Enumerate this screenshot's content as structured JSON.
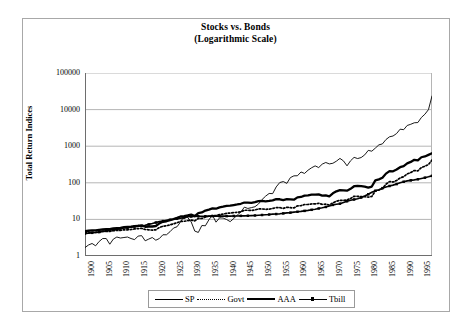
{
  "chart_data": {
    "type": "line",
    "title": "Stocks vs. Bonds",
    "subtitle": "(Logarithmic Scale)",
    "xlabel": "",
    "ylabel": "Total Return Indices",
    "scale": "log",
    "grid": true,
    "legend_position": "bottom",
    "ylim": [
      1,
      100000
    ],
    "xlim": [
      1900,
      1998
    ],
    "ytick_labels": [
      "100000",
      "10000",
      "1000",
      "100",
      "10",
      "1"
    ],
    "ytick_values": [
      100000,
      10000,
      1000,
      100,
      10,
      1
    ],
    "xtick_labels": [
      "1900",
      "1905",
      "1910",
      "1915",
      "1920",
      "1925",
      "1930",
      "1935",
      "1940",
      "1945",
      "1950",
      "1955",
      "1960",
      "1965",
      "1970",
      "1975",
      "1980",
      "1985",
      "1990",
      "1995"
    ],
    "xtick_values": [
      1900,
      1905,
      1910,
      1915,
      1920,
      1925,
      1930,
      1935,
      1940,
      1945,
      1950,
      1955,
      1960,
      1965,
      1970,
      1975,
      1980,
      1985,
      1990,
      1995
    ],
    "x": [
      1900,
      1901,
      1902,
      1903,
      1904,
      1905,
      1906,
      1907,
      1908,
      1909,
      1910,
      1911,
      1912,
      1913,
      1914,
      1915,
      1916,
      1917,
      1918,
      1919,
      1920,
      1921,
      1922,
      1923,
      1924,
      1925,
      1926,
      1927,
      1928,
      1929,
      1930,
      1931,
      1932,
      1933,
      1934,
      1935,
      1936,
      1937,
      1938,
      1939,
      1940,
      1941,
      1942,
      1943,
      1944,
      1945,
      1946,
      1947,
      1948,
      1949,
      1950,
      1951,
      1952,
      1953,
      1954,
      1955,
      1956,
      1957,
      1958,
      1959,
      1960,
      1961,
      1962,
      1963,
      1964,
      1965,
      1966,
      1967,
      1968,
      1969,
      1970,
      1971,
      1972,
      1973,
      1974,
      1975,
      1976,
      1977,
      1978,
      1979,
      1980,
      1981,
      1982,
      1983,
      1984,
      1985,
      1986,
      1987,
      1988,
      1989,
      1990,
      1991,
      1992,
      1993,
      1994,
      1995,
      1996,
      1997,
      1998
    ],
    "series": [
      {
        "name": "SP",
        "style": "thin-solid",
        "color": "#000000",
        "values": [
          1.7,
          2.0,
          2.2,
          1.9,
          2.5,
          3.0,
          3.0,
          2.1,
          2.9,
          3.3,
          3.1,
          3.2,
          3.3,
          3.0,
          2.8,
          3.5,
          3.6,
          2.6,
          2.9,
          3.2,
          2.7,
          3.0,
          3.8,
          3.8,
          4.6,
          5.8,
          6.3,
          8.6,
          12.3,
          11.3,
          8.5,
          4.8,
          4.4,
          6.8,
          6.7,
          9.8,
          13.1,
          8.4,
          11.0,
          10.9,
          9.9,
          8.7,
          10.5,
          13.2,
          15.8,
          21.6,
          19.9,
          21.0,
          22.2,
          26.4,
          34.8,
          43.1,
          51.1,
          50.6,
          77.2,
          101.5,
          108.1,
          96.5,
          138.5,
          155.0,
          155.8,
          197.5,
          180.3,
          221.2,
          257.9,
          290.0,
          260.9,
          323.4,
          358.8,
          328.2,
          341.4,
          390.2,
          464.2,
          396.0,
          291.0,
          399.6,
          495.2,
          459.9,
          489.9,
          580.4,
          768.4,
          730.6,
          887.9,
          1088.0,
          1156.0,
          1522.0,
          1806.0,
          1901.0,
          2216.0,
          2917.0,
          2825.0,
          3688.0,
          3969.0,
          4368.0,
          4425.0,
          6088.0,
          7484.0,
          9978.0,
          23500.0
        ]
      },
      {
        "name": "Govt",
        "style": "dotted",
        "color": "#000000",
        "values": [
          4.3,
          4.3,
          4.4,
          4.4,
          4.6,
          4.7,
          4.7,
          4.7,
          4.9,
          5.0,
          5.0,
          5.2,
          5.2,
          5.3,
          5.5,
          5.6,
          5.7,
          5.3,
          5.2,
          5.1,
          5.2,
          6.0,
          6.5,
          6.7,
          7.1,
          7.6,
          8.1,
          8.8,
          8.9,
          9.2,
          9.6,
          9.1,
          10.6,
          10.6,
          11.6,
          12.2,
          12.8,
          12.8,
          13.5,
          13.9,
          14.7,
          14.9,
          15.3,
          15.7,
          16.1,
          17.8,
          17.8,
          17.5,
          18.1,
          19.3,
          19.3,
          18.8,
          19.1,
          19.8,
          21.1,
          20.9,
          20.0,
          21.4,
          20.9,
          20.5,
          23.4,
          23.7,
          25.5,
          25.5,
          26.4,
          26.6,
          27.5,
          25.8,
          26.1,
          24.7,
          28.3,
          31.4,
          33.1,
          32.8,
          34.2,
          37.3,
          42.9,
          42.6,
          42.1,
          41.8,
          40.6,
          42.3,
          60.3,
          63.3,
          69.7,
          91.6,
          108.0,
          104.9,
          115.6,
          135.8,
          147.1,
          175.3,
          190.0,
          217.0,
          211.0,
          262.0,
          283.0,
          316.0,
          420.0
        ]
      },
      {
        "name": "AAA",
        "style": "thick-solid",
        "color": "#000000",
        "values": [
          4.8,
          4.9,
          5.0,
          5.0,
          5.2,
          5.3,
          5.4,
          5.4,
          5.7,
          5.8,
          5.9,
          6.1,
          6.2,
          6.3,
          6.5,
          6.7,
          6.8,
          6.3,
          6.4,
          6.4,
          6.6,
          7.8,
          8.6,
          8.9,
          9.6,
          10.2,
          11.0,
          12.0,
          12.3,
          12.8,
          13.5,
          12.3,
          14.8,
          15.5,
          17.4,
          18.6,
          20.0,
          19.6,
          21.4,
          22.2,
          23.5,
          23.7,
          24.7,
          25.6,
          26.7,
          28.9,
          28.8,
          28.2,
          29.5,
          31.7,
          32.0,
          31.1,
          32.0,
          33.2,
          35.8,
          35.5,
          33.8,
          35.9,
          35.2,
          34.6,
          40.0,
          41.0,
          44.6,
          45.2,
          47.3,
          47.7,
          48.3,
          44.6,
          45.6,
          42.8,
          51.5,
          58.4,
          62.7,
          62.3,
          60.9,
          68.4,
          80.7,
          82.1,
          81.2,
          78.5,
          73.7,
          79.1,
          116.0,
          124.0,
          137.0,
          178.0,
          208.0,
          206.0,
          230.0,
          267.0,
          286.0,
          340.0,
          372.0,
          424.0,
          408.0,
          499.0,
          525.0,
          580.0,
          640.0
        ]
      },
      {
        "name": "Tbill",
        "style": "marker-line",
        "color": "#000000",
        "values": [
          4.1,
          4.2,
          4.3,
          4.4,
          4.5,
          4.7,
          4.9,
          5.1,
          5.2,
          5.3,
          5.6,
          5.8,
          5.9,
          6.2,
          6.4,
          6.5,
          6.7,
          6.9,
          7.3,
          7.7,
          8.2,
          8.7,
          9.0,
          9.4,
          9.8,
          10.1,
          10.5,
          10.8,
          11.2,
          11.8,
          12.0,
          12.1,
          12.2,
          12.2,
          12.2,
          12.3,
          12.3,
          12.3,
          12.3,
          12.3,
          12.3,
          12.3,
          12.4,
          12.4,
          12.5,
          12.5,
          12.6,
          12.7,
          12.8,
          13.0,
          13.2,
          13.4,
          13.6,
          13.9,
          14.0,
          14.2,
          14.6,
          15.1,
          15.3,
          15.8,
          16.2,
          16.6,
          17.1,
          17.6,
          18.3,
          19.0,
          19.9,
          20.8,
          21.9,
          23.3,
          24.9,
          25.9,
          26.9,
          28.9,
          31.3,
          33.3,
          35.0,
          36.8,
          39.5,
          43.6,
          48.5,
          55.2,
          60.6,
          65.0,
          71.4,
          76.9,
          81.8,
          86.3,
          92.2,
          99.6,
          106.9,
          112.8,
          116.6,
          120.1,
          124.7,
          131.7,
          138.2,
          145.5,
          155.0
        ]
      }
    ]
  },
  "legend": {
    "entries": [
      {
        "label": "SP",
        "style": "thin-solid"
      },
      {
        "label": "Govt",
        "style": "dotted"
      },
      {
        "label": "AAA",
        "style": "thick-solid"
      },
      {
        "label": "Tbill",
        "style": "marker-line"
      }
    ]
  },
  "colors": {
    "line": "#000000",
    "grid": "#b5b5b5",
    "axis": "#6e6e6e",
    "frame": "#a8a8a8",
    "background": "#ffffff"
  }
}
